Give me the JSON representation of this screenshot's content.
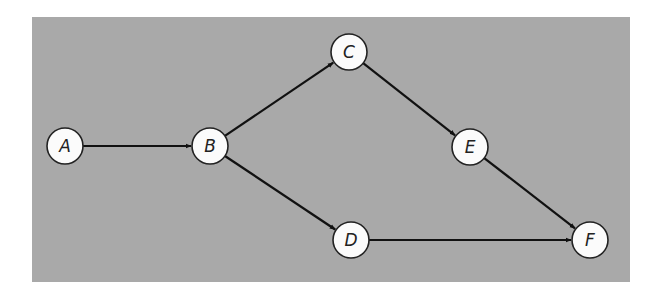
{
  "diagram": {
    "type": "directed-graph",
    "colors": {
      "background": "#ffffff",
      "panel": "#a9a9a9",
      "node_fill": "#fbfbfb",
      "node_stroke": "#222222",
      "edge": "#111111"
    },
    "panel": {
      "x": 32,
      "y": 17,
      "width": 598,
      "height": 265
    },
    "node_radius": 18,
    "nodes": [
      {
        "id": "A",
        "label": "A",
        "x": 65,
        "y": 146
      },
      {
        "id": "B",
        "label": "B",
        "x": 210,
        "y": 146
      },
      {
        "id": "C",
        "label": "C",
        "x": 349,
        "y": 52
      },
      {
        "id": "D",
        "label": "D",
        "x": 351,
        "y": 240
      },
      {
        "id": "E",
        "label": "E",
        "x": 470,
        "y": 147
      },
      {
        "id": "F",
        "label": "F",
        "x": 590,
        "y": 240
      }
    ],
    "edges": [
      {
        "from": "A",
        "to": "B"
      },
      {
        "from": "B",
        "to": "C"
      },
      {
        "from": "B",
        "to": "D"
      },
      {
        "from": "C",
        "to": "E"
      },
      {
        "from": "E",
        "to": "F"
      },
      {
        "from": "D",
        "to": "F"
      }
    ]
  }
}
